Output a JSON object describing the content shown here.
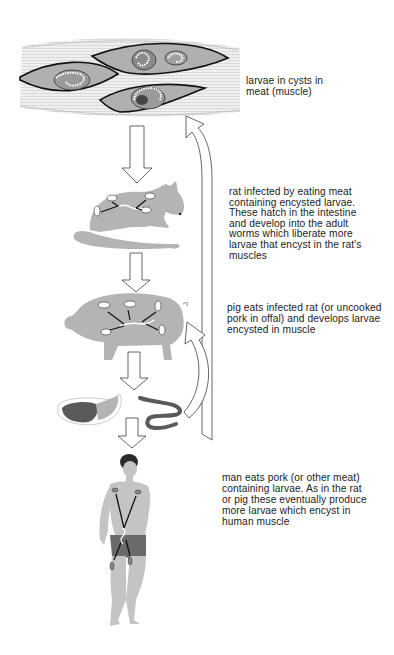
{
  "diagram": {
    "colors": {
      "flesh_grey": "#b4b4b4",
      "muscle_fiber": "#e6e6e6",
      "outline": "#111111",
      "cyst_dark": "#555555",
      "meat_dark": "#5a5a5a",
      "shorts": "#6a6a6a",
      "arrow_fill": "#ffffff",
      "arrow_stroke": "#555555"
    },
    "stages": [
      {
        "id": "muscle",
        "icon": "muscle-cyst-icon",
        "caption_lines": [
          "larvae in cysts in",
          "meat (muscle)"
        ]
      },
      {
        "id": "rat",
        "icon": "rat-icon",
        "caption_lines": [
          "rat infected by eating  meat",
          "containing encysted larvae.",
          "These hatch in the intestine",
          "and develop into the  adult",
          "worms which liberate more",
          "larvae that encyst in the rat's",
          "muscles"
        ]
      },
      {
        "id": "pig",
        "icon": "pig-icon",
        "caption_lines": [
          "pig eats infected rat (or  uncooked",
          "pork in offal) and develops larvae",
          "encysted in muscle"
        ]
      },
      {
        "id": "pork",
        "icon": "pork-ham-icon",
        "secondary_icon": "offal-intestine-icon",
        "caption_lines": []
      },
      {
        "id": "man",
        "icon": "human-icon",
        "caption_lines": [
          "man  eats pork (or other meat)",
          "containing larvae. As in the rat",
          "or pig these eventually produce",
          "more larvae which encyst in",
          "human muscle"
        ]
      }
    ],
    "arrows": [
      {
        "from": "muscle",
        "to": "rat",
        "type": "down-arrow"
      },
      {
        "from": "rat",
        "to": "pig",
        "type": "down-arrow"
      },
      {
        "from": "pig",
        "to": "pork",
        "type": "down-arrow"
      },
      {
        "from": "pork",
        "to": "man",
        "type": "down-arrow"
      },
      {
        "from": "offal",
        "to": "muscle",
        "type": "curved-return-arrow"
      },
      {
        "from": "offal",
        "to": "pig",
        "type": "curved-return-arrow"
      }
    ]
  }
}
